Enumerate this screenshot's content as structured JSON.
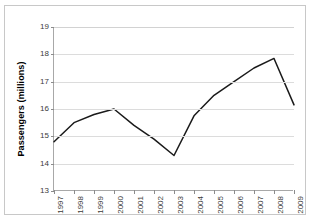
{
  "chart_data": {
    "type": "line",
    "title": "",
    "xlabel": "",
    "ylabel": "Passengers (millions)",
    "categories": [
      "1997",
      "1998",
      "1999",
      "2000",
      "2001",
      "2002",
      "2003",
      "2004",
      "2005",
      "2006",
      "2007",
      "2008",
      "2009"
    ],
    "values": [
      14.8,
      15.5,
      15.8,
      16.0,
      15.4,
      14.9,
      14.3,
      15.75,
      16.5,
      17.0,
      17.5,
      17.85,
      16.15
    ],
    "series": [
      {
        "name": "Passengers",
        "values": [
          14.8,
          15.5,
          15.8,
          16.0,
          15.4,
          14.9,
          14.3,
          15.75,
          16.5,
          17.0,
          17.5,
          17.85,
          16.15
        ]
      }
    ],
    "ylim": [
      13,
      19
    ],
    "yticks": [
      13,
      14,
      15,
      16,
      17,
      18,
      19
    ],
    "ytick_labels": [
      "13",
      "14",
      "15",
      "16",
      "17",
      "18",
      "19"
    ],
    "xlim": [
      0,
      12
    ],
    "grid": true,
    "grid_axis": "y",
    "legend": false,
    "legend_position": "none",
    "line_color": "#1a1a1a",
    "line_width": 1.5,
    "markers": false,
    "background_color": "#ffffff",
    "grid_color": "#dcdcdc",
    "axis_color": "#a8a8a8"
  }
}
